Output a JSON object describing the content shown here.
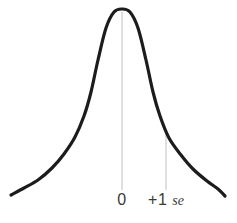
{
  "style": {
    "background": "#ffffff",
    "curve_color": "#1c1c1c",
    "curve_stroke_width": 3.2,
    "reference_line_color": "#c0c0c0",
    "reference_line_width": 1,
    "label_color": "#3a3a3a"
  },
  "chart_data": {
    "type": "line",
    "title": "",
    "xlabel": "",
    "ylabel": "",
    "grid": false,
    "legend": false,
    "x_axis_marks": [
      {
        "value": 0,
        "label": "0"
      },
      {
        "value": 1,
        "label": "+1 se",
        "prefix": "+1 ",
        "unit": "se"
      }
    ],
    "curve": {
      "shape": "normal-bell",
      "peak_px": [
        122,
        9
      ],
      "points_px": [
        [
          11,
          195
        ],
        [
          24,
          188
        ],
        [
          38,
          180
        ],
        [
          52,
          168
        ],
        [
          64,
          154
        ],
        [
          75,
          137
        ],
        [
          84,
          116
        ],
        [
          91,
          92
        ],
        [
          98,
          60
        ],
        [
          106,
          28
        ],
        [
          114,
          12
        ],
        [
          122,
          9
        ],
        [
          130,
          12
        ],
        [
          138,
          28
        ],
        [
          146,
          60
        ],
        [
          153,
          92
        ],
        [
          160,
          116
        ],
        [
          169,
          138
        ],
        [
          181,
          155
        ],
        [
          193,
          169
        ],
        [
          207,
          181
        ],
        [
          218,
          189
        ],
        [
          225,
          196
        ]
      ]
    },
    "markers_px": [
      {
        "x": 122,
        "top": 12,
        "bottom": 190,
        "label": "0"
      },
      {
        "x": 166,
        "top": 130,
        "bottom": 190,
        "label": "+1 se"
      }
    ]
  }
}
